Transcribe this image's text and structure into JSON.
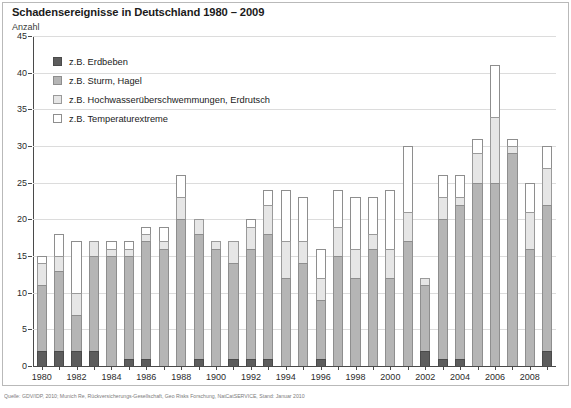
{
  "header": {
    "title": "Schadensereignisse in Deutschland 1980 – 2009",
    "y_axis_caption": "Anzahl"
  },
  "footer": {
    "source": "Quelle: GDV/IDP, 2010; Munich Re, Rückversicherungs-Gesellschaft, Geo Risks Forschung, NatCatSERVICE, Stand: Januar 2010"
  },
  "legend": {
    "position": "inside-top-left",
    "items": [
      {
        "label": "z.B. Erdbeben",
        "color": "#5d5d5d",
        "swatch": "legend-swatch-erdbeben"
      },
      {
        "label": "z.B. Sturm, Hagel",
        "color": "#b5b5b5",
        "swatch": "legend-swatch-sturm-hagel"
      },
      {
        "label": "z.B. Hochwasserüberschwemmungen, Erdrutsch",
        "color": "#e6e6e6",
        "swatch": "legend-swatch-hochwasser"
      },
      {
        "label": "z.B. Temperaturextreme",
        "color": "#ffffff",
        "swatch": "legend-swatch-temperaturextreme"
      }
    ]
  },
  "chart_data": {
    "type": "bar",
    "stacked": true,
    "title": "Schadensereignisse in Deutschland 1980 – 2009",
    "xlabel": "",
    "ylabel": "Anzahl",
    "ylim": [
      0,
      45
    ],
    "yticks": [
      0,
      5,
      10,
      15,
      20,
      25,
      30,
      35,
      40,
      45
    ],
    "grid": true,
    "categories": [
      "1980",
      "1981",
      "1982",
      "1983",
      "1984",
      "1985",
      "1986",
      "1987",
      "1988",
      "1989",
      "1990",
      "1991",
      "1992",
      "1993",
      "1994",
      "1995",
      "1996",
      "1997",
      "1998",
      "1999",
      "2000",
      "2001",
      "2002",
      "2003",
      "2004",
      "2005",
      "2006",
      "2007",
      "2008",
      "2009"
    ],
    "xtick_labels": [
      "1980",
      "1982",
      "1984",
      "1986",
      "1988",
      "1900",
      "1992",
      "1994",
      "1996",
      "1998",
      "2000",
      "2002",
      "2004",
      "2006",
      "2008"
    ],
    "xtick_label_note": "Tick label shown at the 1990 position is printed as '1900' in the source graphic.",
    "series": [
      {
        "name": "z.B. Erdbeben",
        "color": "#5d5d5d",
        "values": [
          2,
          2,
          2,
          2,
          0,
          1,
          1,
          0,
          0,
          1,
          0,
          1,
          1,
          1,
          0,
          0,
          1,
          0,
          0,
          0,
          0,
          0,
          2,
          1,
          1,
          0,
          0,
          0,
          0,
          2
        ]
      },
      {
        "name": "z.B. Sturm, Hagel",
        "color": "#b5b5b5",
        "values": [
          9,
          11,
          5,
          13,
          15,
          14,
          16,
          16,
          20,
          17,
          16,
          13,
          15,
          17,
          12,
          14,
          8,
          15,
          12,
          16,
          12,
          17,
          9,
          19,
          21,
          25,
          25,
          29,
          16,
          20
        ]
      },
      {
        "name": "z.B. Hochwasserüberschwemmungen, Erdrutsch",
        "color": "#e6e6e6",
        "values": [
          3,
          2,
          3,
          2,
          1,
          1,
          1,
          1,
          3,
          2,
          1,
          3,
          3,
          4,
          5,
          3,
          3,
          4,
          4,
          2,
          4,
          4,
          1,
          3,
          1,
          4,
          9,
          1,
          5,
          5
        ]
      },
      {
        "name": "z.B. Temperaturextreme",
        "color": "#ffffff",
        "values": [
          1,
          3,
          7,
          0,
          1,
          1,
          1,
          2,
          3,
          0,
          0,
          0,
          1,
          2,
          7,
          6,
          4,
          5,
          7,
          5,
          8,
          9,
          0,
          3,
          3,
          2,
          7,
          1,
          4,
          3
        ]
      }
    ],
    "totals": [
      15,
      18,
      17,
      17,
      17,
      17,
      19,
      19,
      26,
      20,
      17,
      17,
      20,
      24,
      24,
      23,
      16,
      24,
      23,
      23,
      24,
      30,
      12,
      26,
      26,
      31,
      41,
      31,
      25,
      30
    ]
  }
}
